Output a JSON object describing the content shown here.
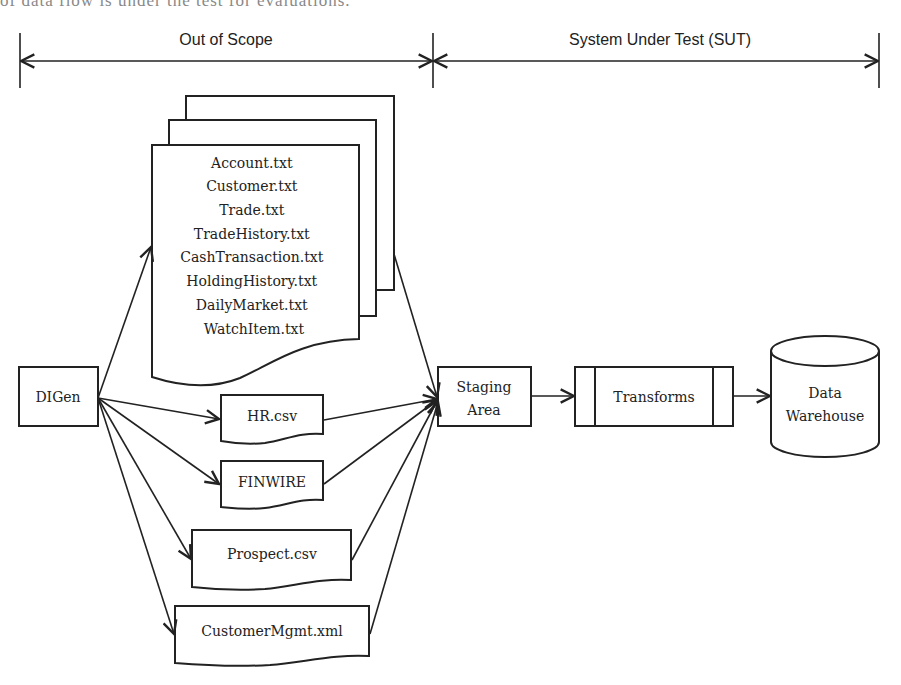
{
  "caption_cutoff": "of data flow is under the test for evaluations.",
  "scopes": {
    "out_of_scope": "Out of Scope",
    "sut": "System Under Test (SUT)"
  },
  "source": {
    "label": "DIGen"
  },
  "file_stack": {
    "files": [
      "Account.txt",
      "Customer.txt",
      "Trade.txt",
      "TradeHistory.txt",
      "CashTransaction.txt",
      "HoldingHistory.txt",
      "DailyMarket.txt",
      "WatchItem.txt"
    ]
  },
  "documents": {
    "hr": "HR.csv",
    "finwire": "FINWIRE",
    "prospect": "Prospect.csv",
    "customer_mgmt": "CustomerMgmt.xml"
  },
  "staging": {
    "line1": "Staging",
    "line2": "Area"
  },
  "transforms": {
    "label": "Transforms"
  },
  "warehouse": {
    "line1": "Data",
    "line2": "Warehouse"
  }
}
